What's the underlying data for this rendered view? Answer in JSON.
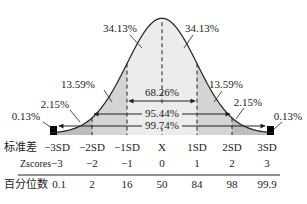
{
  "chart_data": {
    "type": "area",
    "title": "",
    "mean": 0,
    "sd": 1,
    "xlim": [
      -3,
      3
    ],
    "band_percentages": [
      {
        "label": "0.13%",
        "from": -4,
        "to": -3,
        "side": "left"
      },
      {
        "label": "2.15%",
        "from": -3,
        "to": -2,
        "side": "left"
      },
      {
        "label": "13.59%",
        "from": -2,
        "to": -1,
        "side": "left"
      },
      {
        "label": "34.13%",
        "from": -1,
        "to": 0,
        "side": "left"
      },
      {
        "label": "34.13%",
        "from": 0,
        "to": 1,
        "side": "right"
      },
      {
        "label": "13.59%",
        "from": 1,
        "to": 2,
        "side": "right"
      },
      {
        "label": "2.15%",
        "from": 2,
        "to": 3,
        "side": "right"
      },
      {
        "label": "0.13%",
        "from": 3,
        "to": 4,
        "side": "right"
      }
    ],
    "intervals": [
      {
        "label": "68.26%",
        "from": -1,
        "to": 1
      },
      {
        "label": "95.44%",
        "from": -2,
        "to": 2
      },
      {
        "label": "99.74%",
        "from": -3,
        "to": 3
      }
    ],
    "table": {
      "rows": [
        {
          "header": "标准差",
          "values": [
            "−3SD",
            "−2SD",
            "−1SD",
            "X",
            "1SD",
            "2SD",
            "3SD"
          ]
        },
        {
          "header": "Zscores",
          "values": [
            "−3",
            "−2",
            "−1",
            "0",
            "1",
            "2",
            "3"
          ]
        },
        {
          "header": "百分位数",
          "values": [
            "0.1",
            "2",
            "16",
            "50",
            "84",
            "98",
            "99.9"
          ]
        }
      ]
    },
    "colors": {
      "center_fill": "#ececec",
      "mid_fill": "#d4d4d4",
      "outer_fill": "#bdbdbd",
      "tail_fill": "#000000",
      "line": "#222222"
    }
  }
}
